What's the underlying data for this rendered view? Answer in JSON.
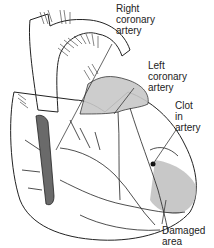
{
  "figure": {
    "labels": [
      {
        "id": "right-coronary-artery",
        "text": "Right\ncoronary\nartery"
      },
      {
        "id": "left-coronary-artery",
        "text": "Left\ncoronary\nartery"
      },
      {
        "id": "clot-in-artery",
        "text": "Clot\nin\nartery"
      },
      {
        "id": "damaged-area",
        "text": "Damaged\narea"
      }
    ],
    "colors": {
      "line": "#222222",
      "shade": "#9a9a9a",
      "damage": "#b5b5b5",
      "background": "#ffffff"
    }
  }
}
